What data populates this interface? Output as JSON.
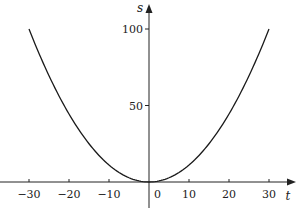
{
  "chart_data": {
    "type": "line",
    "title": "",
    "xlabel": "t",
    "ylabel": "s",
    "xlim": [
      -36,
      36
    ],
    "ylim": [
      0,
      115
    ],
    "grid": false,
    "legend": null,
    "x_ticks": [
      -30,
      -20,
      -10,
      0,
      10,
      20,
      30
    ],
    "x_tick_labels": [
      "−30",
      "−20",
      "−10",
      "0",
      "10",
      "20",
      "30"
    ],
    "y_ticks": [
      50,
      100
    ],
    "y_tick_labels": [
      "50",
      "100"
    ],
    "series": [
      {
        "name": "s = t²/9",
        "x": [
          -30,
          -25,
          -20,
          -15,
          -10,
          -5,
          0,
          5,
          10,
          15,
          20,
          25,
          30
        ],
        "values": [
          100,
          69.4,
          44.4,
          25,
          11.1,
          2.8,
          0,
          2.8,
          11.1,
          25,
          44.4,
          69.4,
          100
        ]
      }
    ]
  }
}
